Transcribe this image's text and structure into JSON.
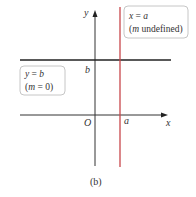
{
  "diagram": {
    "caption": "(b)",
    "axes": {
      "x_label": "x",
      "y_label": "y",
      "origin_label": "O",
      "x_tick_label": "a",
      "y_tick_label": "b"
    },
    "vertical_line": {
      "equation_lhs": "x",
      "equation_eq": " = ",
      "equation_rhs": "a",
      "note_open": "(",
      "note_var": "m",
      "note_text": " undefined)",
      "color": "#c8464b"
    },
    "horizontal_line": {
      "equation_lhs": "y",
      "equation_eq": " = ",
      "equation_rhs": "b",
      "note_open": "(",
      "note_var": "m",
      "note_text": " = 0)",
      "color": "#222222"
    }
  }
}
